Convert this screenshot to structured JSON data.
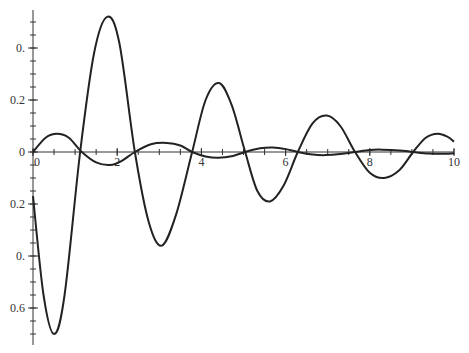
{
  "chart_data": {
    "type": "line",
    "title": "",
    "xlabel": "",
    "ylabel": "",
    "xlim": [
      0,
      10
    ],
    "ylim": [
      -0.72,
      0.58
    ],
    "grid": false,
    "legend": null,
    "x_ticks": [
      {
        "value": 0,
        "label": "0"
      },
      {
        "value": 2,
        "label": "2"
      },
      {
        "value": 4,
        "label": "4"
      },
      {
        "value": 6,
        "label": "6"
      },
      {
        "value": 8,
        "label": "8"
      },
      {
        "value": 10,
        "label": "10"
      }
    ],
    "y_ticks": [
      {
        "value": 0.4,
        "label": "0."
      },
      {
        "value": 0.2,
        "label": "0.2"
      },
      {
        "value": 0,
        "label": "0"
      },
      {
        "value": -0.2,
        "label": "0.2"
      },
      {
        "value": -0.4,
        "label": "0."
      },
      {
        "value": -0.6,
        "label": "0.6"
      }
    ],
    "series": [
      {
        "name": "large-oscillation",
        "color": "#222222",
        "points": [
          [
            0,
            -0.17
          ],
          [
            0.25,
            -0.55
          ],
          [
            0.5,
            -0.7
          ],
          [
            0.75,
            -0.55
          ],
          [
            1.12,
            0.0
          ],
          [
            1.45,
            0.38
          ],
          [
            1.76,
            0.52
          ],
          [
            2.05,
            0.42
          ],
          [
            2.42,
            0.0
          ],
          [
            2.75,
            -0.27
          ],
          [
            3.06,
            -0.36
          ],
          [
            3.4,
            -0.24
          ],
          [
            3.78,
            0.0
          ],
          [
            4.1,
            0.2
          ],
          [
            4.42,
            0.265
          ],
          [
            4.72,
            0.18
          ],
          [
            5.04,
            0.0
          ],
          [
            5.33,
            -0.15
          ],
          [
            5.63,
            -0.19
          ],
          [
            5.95,
            -0.13
          ],
          [
            6.29,
            0.0
          ],
          [
            6.64,
            0.11
          ],
          [
            6.98,
            0.14
          ],
          [
            7.3,
            0.1
          ],
          [
            7.65,
            0.0
          ],
          [
            8.0,
            -0.08
          ],
          [
            8.34,
            -0.1
          ],
          [
            8.7,
            -0.07
          ],
          [
            9.03,
            0.0
          ],
          [
            9.33,
            0.055
          ],
          [
            9.62,
            0.07
          ],
          [
            9.85,
            0.058
          ],
          [
            10,
            0.04
          ]
        ]
      },
      {
        "name": "small-oscillation",
        "color": "#222222",
        "points": [
          [
            0,
            0.0
          ],
          [
            0.3,
            0.055
          ],
          [
            0.57,
            0.07
          ],
          [
            0.85,
            0.055
          ],
          [
            1.16,
            0.0
          ],
          [
            1.5,
            -0.04
          ],
          [
            1.83,
            -0.05
          ],
          [
            2.1,
            -0.035
          ],
          [
            2.42,
            0.0
          ],
          [
            2.8,
            0.03
          ],
          [
            3.18,
            0.035
          ],
          [
            3.5,
            0.025
          ],
          [
            3.78,
            0.0
          ],
          [
            4.1,
            -0.017
          ],
          [
            4.4,
            -0.022
          ],
          [
            4.75,
            -0.015
          ],
          [
            5.04,
            0.0
          ],
          [
            5.4,
            0.014
          ],
          [
            5.7,
            0.017
          ],
          [
            6.0,
            0.011
          ],
          [
            6.29,
            0.0
          ],
          [
            6.65,
            -0.01
          ],
          [
            6.95,
            -0.012
          ],
          [
            7.3,
            -0.008
          ],
          [
            7.65,
            0.0
          ],
          [
            8.0,
            0.008
          ],
          [
            8.3,
            0.009
          ],
          [
            8.7,
            0.006
          ],
          [
            9.03,
            0.0
          ],
          [
            9.4,
            -0.006
          ],
          [
            9.7,
            -0.007
          ],
          [
            10,
            -0.005
          ]
        ]
      }
    ]
  },
  "layout": {
    "x0_px": 33,
    "x_px_per_unit": 42.1,
    "y0_px": 152,
    "y_px_per_unit": 260,
    "y_axis_top_px": 10,
    "y_axis_bottom_px": 345
  }
}
